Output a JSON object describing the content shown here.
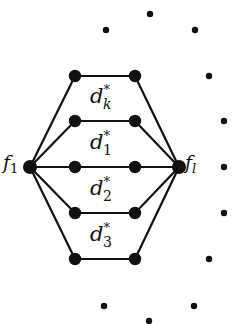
{
  "diagram": {
    "colors": {
      "stroke": "#111111",
      "node": "#111111",
      "background": "#ffffff"
    },
    "end_nodes": {
      "left": {
        "label": "f",
        "sub": "1",
        "x": 30,
        "y": 167
      },
      "right": {
        "label": "f",
        "sub": "l",
        "x": 179,
        "y": 167
      }
    },
    "paths": [
      {
        "y": 76,
        "x1": 75,
        "x2": 135
      },
      {
        "y": 121,
        "x1": 75,
        "x2": 135
      },
      {
        "y": 167,
        "x1": 75,
        "x2": 135
      },
      {
        "y": 213,
        "x1": 75,
        "x2": 135
      },
      {
        "y": 259,
        "x1": 75,
        "x2": 135
      }
    ],
    "region_labels": [
      {
        "base": "d",
        "sup": "*",
        "sub": "k",
        "x": 90,
        "y": 103
      },
      {
        "base": "d",
        "sup": "*",
        "sub": "1",
        "x": 90,
        "y": 149
      },
      {
        "base": "d",
        "sup": "*",
        "sub": "2",
        "x": 90,
        "y": 195
      },
      {
        "base": "d",
        "sup": "*",
        "sub": "3",
        "x": 90,
        "y": 241
      }
    ],
    "ellipsis_dots": [
      {
        "x": 106,
        "y": 30
      },
      {
        "x": 150,
        "y": 14
      },
      {
        "x": 195,
        "y": 30
      },
      {
        "x": 209,
        "y": 76
      },
      {
        "x": 224,
        "y": 121
      },
      {
        "x": 224,
        "y": 167
      },
      {
        "x": 224,
        "y": 213
      },
      {
        "x": 209,
        "y": 259
      },
      {
        "x": 104,
        "y": 306
      },
      {
        "x": 149,
        "y": 321
      },
      {
        "x": 194,
        "y": 306
      }
    ]
  }
}
